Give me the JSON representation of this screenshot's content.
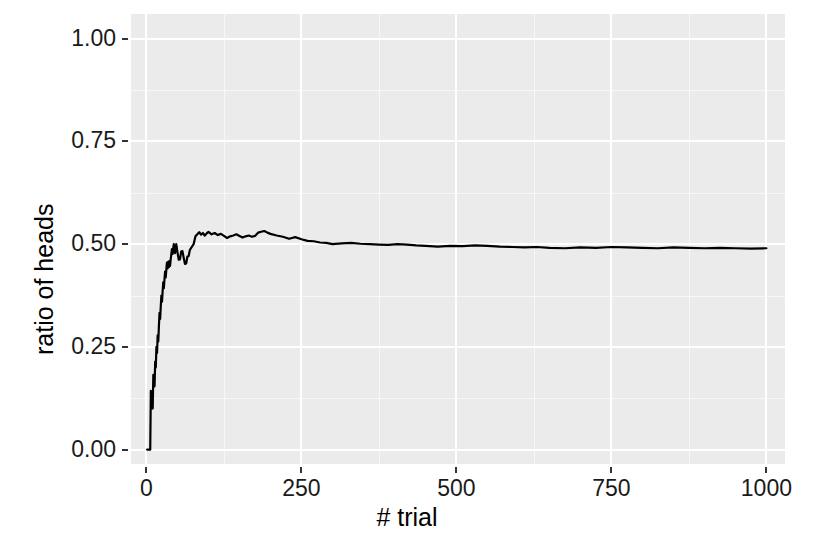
{
  "chart_data": {
    "type": "line",
    "title": "",
    "subtitle": "",
    "xlabel": "# trial",
    "ylabel": "ratio of heads",
    "xlim": [
      -25,
      1030
    ],
    "ylim": [
      -0.035,
      1.06
    ],
    "grid": true,
    "legend": null,
    "x_ticks": [
      0,
      250,
      500,
      750,
      1000
    ],
    "x_tick_labels": [
      "0",
      "250",
      "500",
      "750",
      "1000"
    ],
    "y_ticks": [
      0.0,
      0.25,
      0.5,
      0.75,
      1.0
    ],
    "y_tick_labels": [
      "0.00",
      "0.25",
      "0.50",
      "0.75",
      "1.00"
    ],
    "x_minor_ticks": [
      125,
      375,
      625,
      875
    ],
    "y_minor_ticks": [
      0.125,
      0.375,
      0.625,
      0.875
    ],
    "panel_background": "#ebebeb",
    "gridline_color": "#ffffff",
    "line_color": "#000000",
    "line_width": 2,
    "series": [
      {
        "name": "ratio of heads",
        "x": [
          1,
          2,
          3,
          4,
          5,
          6,
          7,
          8,
          9,
          10,
          11,
          12,
          13,
          14,
          15,
          16,
          17,
          18,
          19,
          20,
          21,
          22,
          23,
          24,
          25,
          26,
          27,
          28,
          29,
          30,
          31,
          32,
          33,
          34,
          35,
          36,
          37,
          38,
          39,
          40,
          41,
          42,
          43,
          44,
          45,
          46,
          47,
          48,
          49,
          50,
          52,
          54,
          56,
          58,
          60,
          62,
          64,
          66,
          68,
          70,
          73,
          76,
          79,
          82,
          85,
          88,
          91,
          94,
          97,
          100,
          105,
          110,
          115,
          120,
          125,
          130,
          135,
          140,
          145,
          150,
          155,
          160,
          165,
          170,
          175,
          180,
          185,
          190,
          195,
          200,
          210,
          220,
          230,
          240,
          250,
          260,
          270,
          280,
          290,
          300,
          315,
          330,
          345,
          360,
          375,
          390,
          405,
          420,
          435,
          450,
          470,
          490,
          510,
          530,
          550,
          570,
          590,
          610,
          630,
          650,
          675,
          700,
          725,
          750,
          775,
          800,
          825,
          850,
          875,
          900,
          925,
          950,
          975,
          1000
        ],
        "y": [
          0.0,
          0.0,
          0.0,
          0.0,
          0.0,
          0.0,
          0.143,
          0.125,
          0.111,
          0.1,
          0.182,
          0.167,
          0.154,
          0.214,
          0.2,
          0.25,
          0.235,
          0.278,
          0.263,
          0.3,
          0.333,
          0.318,
          0.348,
          0.375,
          0.36,
          0.385,
          0.407,
          0.393,
          0.414,
          0.433,
          0.419,
          0.438,
          0.455,
          0.441,
          0.457,
          0.444,
          0.459,
          0.447,
          0.462,
          0.475,
          0.488,
          0.476,
          0.488,
          0.5,
          0.489,
          0.478,
          0.489,
          0.5,
          0.49,
          0.48,
          0.462,
          0.463,
          0.482,
          0.483,
          0.467,
          0.452,
          0.453,
          0.47,
          0.471,
          0.486,
          0.493,
          0.5,
          0.519,
          0.524,
          0.529,
          0.523,
          0.527,
          0.521,
          0.526,
          0.53,
          0.524,
          0.527,
          0.522,
          0.525,
          0.52,
          0.515,
          0.519,
          0.521,
          0.524,
          0.52,
          0.516,
          0.519,
          0.521,
          0.518,
          0.52,
          0.528,
          0.53,
          0.532,
          0.528,
          0.525,
          0.521,
          0.518,
          0.513,
          0.517,
          0.512,
          0.508,
          0.507,
          0.504,
          0.503,
          0.5,
          0.502,
          0.503,
          0.501,
          0.5,
          0.499,
          0.498,
          0.5,
          0.499,
          0.497,
          0.496,
          0.494,
          0.496,
          0.495,
          0.497,
          0.496,
          0.494,
          0.493,
          0.492,
          0.493,
          0.491,
          0.49,
          0.492,
          0.491,
          0.493,
          0.492,
          0.491,
          0.49,
          0.492,
          0.491,
          0.49,
          0.491,
          0.49,
          0.489,
          0.49
        ]
      }
    ],
    "annotations": []
  },
  "axis": {
    "x_title": "# trial",
    "y_title": "ratio of heads"
  }
}
